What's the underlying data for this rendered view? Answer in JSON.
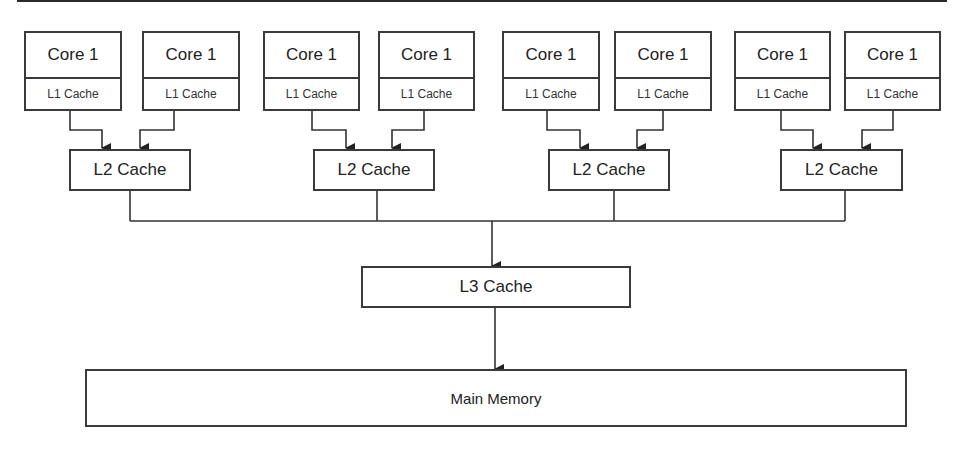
{
  "diagram": {
    "type": "cache-hierarchy",
    "groups": [
      {
        "cores": [
          {
            "core_label": "Core 1",
            "l1_label": "L1 Cache"
          },
          {
            "core_label": "Core 1",
            "l1_label": "L1 Cache"
          }
        ],
        "l2_label": "L2 Cache"
      },
      {
        "cores": [
          {
            "core_label": "Core 1",
            "l1_label": "L1 Cache"
          },
          {
            "core_label": "Core 1",
            "l1_label": "L1 Cache"
          }
        ],
        "l2_label": "L2 Cache"
      },
      {
        "cores": [
          {
            "core_label": "Core 1",
            "l1_label": "L1 Cache"
          },
          {
            "core_label": "Core 1",
            "l1_label": "L1 Cache"
          }
        ],
        "l2_label": "L2 Cache"
      },
      {
        "cores": [
          {
            "core_label": "Core 1",
            "l1_label": "L1 Cache"
          },
          {
            "core_label": "Core 1",
            "l1_label": "L1 Cache"
          }
        ],
        "l2_label": "L2 Cache"
      }
    ],
    "l3_label": "L3 Cache",
    "main_memory_label": "Main Memory",
    "colors": {
      "stroke": "#3a3a3a",
      "background": "#ffffff"
    }
  }
}
